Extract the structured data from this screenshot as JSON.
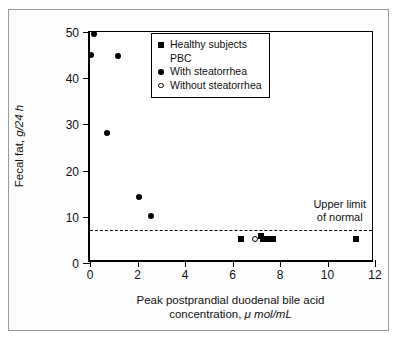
{
  "figure": {
    "background": "#fdfdfd",
    "border_color": "#9a9a9a"
  },
  "chart_data": {
    "type": "scatter",
    "title": "",
    "xlabel_line1": "Peak postprandial duodenal bile acid",
    "xlabel_line2_pre": "concentration, ",
    "xlabel_line2_italic": "μ mol/mL",
    "ylabel_pre": "Fecal fat, ",
    "ylabel_italic": "g/24 h",
    "xlim": [
      0,
      12
    ],
    "ylim": [
      0,
      50
    ],
    "xticks": [
      0,
      2,
      4,
      6,
      8,
      10,
      12
    ],
    "yticks": [
      0,
      10,
      20,
      30,
      40,
      50
    ],
    "xtick_labels": [
      "0",
      "2",
      "4",
      "6",
      "8",
      "10",
      "12"
    ],
    "ytick_labels": [
      "0",
      "10",
      "20",
      "30",
      "40",
      "50"
    ],
    "grid": false,
    "legend_position": "upper right",
    "series": [
      {
        "name": "Healthy subjects",
        "marker": "square-filled",
        "points": [
          {
            "x": 6.35,
            "y": 5.2
          },
          {
            "x": 7.2,
            "y": 5.9
          },
          {
            "x": 7.3,
            "y": 5.2
          },
          {
            "x": 7.45,
            "y": 5.2
          },
          {
            "x": 7.72,
            "y": 5.2
          },
          {
            "x": 11.2,
            "y": 5.2
          }
        ]
      },
      {
        "name": "With steatorrhea",
        "marker": "circle-filled",
        "points": [
          {
            "x": 0.18,
            "y": 49.5
          },
          {
            "x": 0.05,
            "y": 45.0
          },
          {
            "x": 1.18,
            "y": 44.7
          },
          {
            "x": 0.7,
            "y": 28.1
          },
          {
            "x": 2.05,
            "y": 14.3
          },
          {
            "x": 2.58,
            "y": 10.1
          }
        ]
      },
      {
        "name": "Without steatorrhea",
        "marker": "circle-open",
        "points": [
          {
            "x": 6.95,
            "y": 5.3
          }
        ]
      }
    ],
    "annotations": [
      {
        "name": "upper-limit-of-normal",
        "line1": "Upper limit",
        "line2": "of normal",
        "y": 7.1,
        "type": "hline-dashed"
      }
    ]
  },
  "legend": {
    "entries": [
      {
        "label": "Healthy subjects",
        "marker": "square-filled"
      },
      {
        "label": "PBC",
        "marker": "none"
      },
      {
        "label": "With steatorrhea",
        "marker": "circle-filled"
      },
      {
        "label": "Without steatorrhea",
        "marker": "circle-open"
      }
    ]
  }
}
